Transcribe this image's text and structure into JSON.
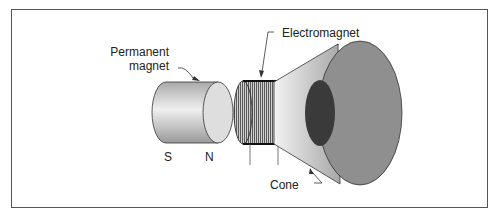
{
  "figure": {
    "type": "loudspeaker-diagram",
    "labels": {
      "permanent_magnet_line1": "Permanent",
      "permanent_magnet_line2": "magnet",
      "electromagnet": "Electromagnet",
      "cone": "Cone",
      "south_pole": "S",
      "north_pole": "N"
    },
    "colors": {
      "border": "#555555",
      "magnet_body": "#c8c8c8",
      "magnet_face": "#dcdcdc",
      "coil": "#8a8a8a",
      "cone_outer": "#bdbdbd",
      "cone_face": "#8c8c8c",
      "cone_hole": "#3a3a3a"
    }
  }
}
